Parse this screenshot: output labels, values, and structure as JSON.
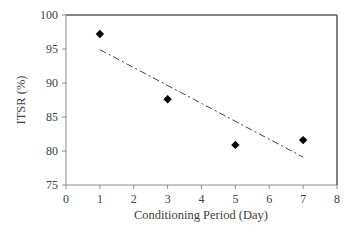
{
  "chart_data": {
    "type": "scatter",
    "title": "",
    "xlabel": "Conditioning Period (Day)",
    "ylabel": "ITSR (%)",
    "xlim": [
      0,
      8
    ],
    "ylim": [
      75,
      100
    ],
    "x_ticks": [
      0,
      1,
      2,
      3,
      4,
      5,
      6,
      7,
      8
    ],
    "y_ticks": [
      75,
      80,
      85,
      90,
      95,
      100
    ],
    "grid": false,
    "legend": null,
    "series": [
      {
        "name": "ITSR",
        "marker": "diamond",
        "color": "#000000",
        "x": [
          1,
          3,
          5,
          7
        ],
        "values": [
          97.2,
          87.6,
          80.9,
          81.6
        ]
      },
      {
        "name": "Trend",
        "style": "dash-dot",
        "color": "#404040",
        "x": [
          1,
          7
        ],
        "values": [
          94.9,
          79.1
        ]
      }
    ]
  }
}
